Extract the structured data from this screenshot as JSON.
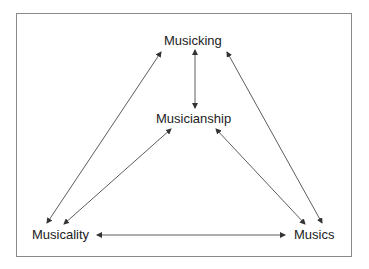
{
  "diagram": {
    "nodes": [
      {
        "id": "musicking",
        "label": "Musicking"
      },
      {
        "id": "musicianship",
        "label": "Musicianship"
      },
      {
        "id": "musicality",
        "label": "Musicality"
      },
      {
        "id": "musics",
        "label": "Musics"
      }
    ],
    "edges": [
      {
        "from": "musicking",
        "to": "musicianship",
        "type": "bidirectional"
      },
      {
        "from": "musicking",
        "to": "musicality",
        "type": "bidirectional"
      },
      {
        "from": "musicking",
        "to": "musics",
        "type": "bidirectional"
      },
      {
        "from": "musicianship",
        "to": "musicality",
        "type": "bidirectional"
      },
      {
        "from": "musicianship",
        "to": "musics",
        "type": "bidirectional"
      },
      {
        "from": "musicality",
        "to": "musics",
        "type": "bidirectional"
      }
    ],
    "colors": {
      "line": "#333333",
      "border": "#8a8a8a",
      "text": "#222222"
    }
  }
}
